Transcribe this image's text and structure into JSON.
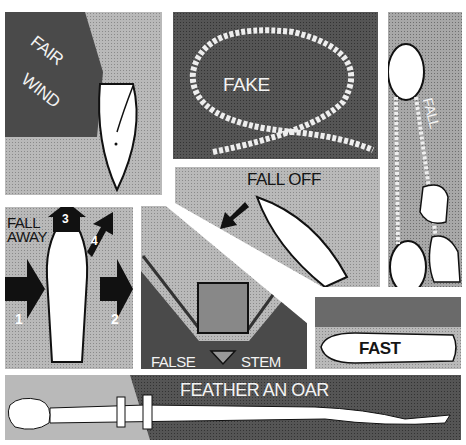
{
  "illustration": {
    "subject": "Nautical glossary terms beginning with F",
    "panels": [
      {
        "id": "fair-wind",
        "label_line1": "FAIR",
        "label_line2": "WIND"
      },
      {
        "id": "fake",
        "label": "FAKE"
      },
      {
        "id": "fall",
        "label": "FALL"
      },
      {
        "id": "fall-off",
        "label": "FALL OFF"
      },
      {
        "id": "fall-away",
        "label_line1": "FALL",
        "label_line2": "AWAY",
        "arrows": [
          "1",
          "2",
          "3",
          "4"
        ]
      },
      {
        "id": "false-stem",
        "label_left": "FALSE",
        "label_right": "STEM"
      },
      {
        "id": "fast",
        "label": "FAST"
      },
      {
        "id": "feather-an-oar",
        "label": "FEATHER AN OAR"
      }
    ]
  },
  "colors": {
    "paper": "#ffffff",
    "light_tone": "#b9b9b9",
    "mid_tone": "#a8a8a8",
    "dark_tone": "#555555",
    "ink": "#151515",
    "hull": "#ffffff"
  }
}
